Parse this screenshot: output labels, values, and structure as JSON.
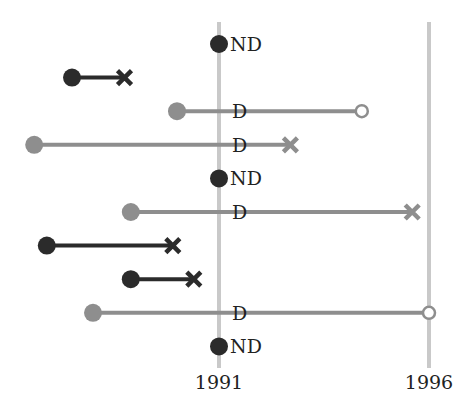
{
  "chart_data": {
    "type": "timeline",
    "title": "",
    "xlabel": "",
    "ylabel": "",
    "x_ticks": [
      {
        "label": "1991",
        "value": 1991
      },
      {
        "label": "1996",
        "value": 1996
      }
    ],
    "grid": "vertical reference lines at 1991 and 1996",
    "legend": null,
    "marker_legend": {
      "filled_dot": "start",
      "cross": "end (event)",
      "open_circle": "end (censored)",
      "ND": "not diagnosed at 1991",
      "D": "diagnosed at 1991"
    },
    "colors": {
      "dark": "#2b2b2b",
      "gray": "#8e8e8e",
      "reference_line": "#c9c9c9",
      "open_marker_fill": "#ffffff"
    },
    "rows": [
      {
        "index": 1,
        "color": "dark",
        "start": 1991.0,
        "end": null,
        "end_marker": null,
        "label": "ND"
      },
      {
        "index": 2,
        "color": "dark",
        "start": 1987.5,
        "end": 1988.75,
        "end_marker": "cross",
        "label": ""
      },
      {
        "index": 3,
        "color": "gray",
        "start": 1990.0,
        "end": 1994.4,
        "end_marker": "open_circle",
        "label": "D"
      },
      {
        "index": 4,
        "color": "gray",
        "start": 1986.6,
        "end": 1992.7,
        "end_marker": "cross",
        "label": "D"
      },
      {
        "index": 5,
        "color": "dark",
        "start": 1991.0,
        "end": null,
        "end_marker": null,
        "label": "ND"
      },
      {
        "index": 6,
        "color": "gray",
        "start": 1988.9,
        "end": 1995.6,
        "end_marker": "cross",
        "label": "D"
      },
      {
        "index": 7,
        "color": "dark",
        "start": 1986.9,
        "end": 1989.9,
        "end_marker": "cross",
        "label": ""
      },
      {
        "index": 8,
        "color": "dark",
        "start": 1988.9,
        "end": 1990.4,
        "end_marker": "cross",
        "label": ""
      },
      {
        "index": 9,
        "color": "gray",
        "start": 1988.0,
        "end": 1996.0,
        "end_marker": "open_circle",
        "label": "D"
      },
      {
        "index": 10,
        "color": "dark",
        "start": 1991.0,
        "end": null,
        "end_marker": null,
        "label": "ND"
      }
    ]
  }
}
